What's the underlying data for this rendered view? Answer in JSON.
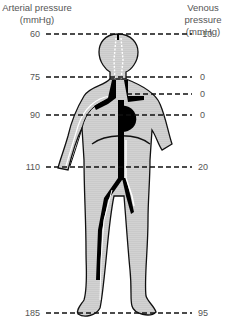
{
  "headers": {
    "arterial": [
      "Arterial pressure",
      "(mmHg)"
    ],
    "venous": [
      "Venous pressure",
      "(mmHg)"
    ]
  },
  "levels": [
    {
      "name": "head-top",
      "arterial": "60",
      "venous": "−10",
      "y": 34
    },
    {
      "name": "neck",
      "arterial": "75",
      "venous": "0",
      "y": 77
    },
    {
      "name": "shoulder",
      "arterial": "",
      "venous": "0",
      "y": 94
    },
    {
      "name": "heart",
      "arterial": "90",
      "venous": "0",
      "y": 115
    },
    {
      "name": "abdomen",
      "arterial": "110",
      "venous": "20",
      "y": 167
    },
    {
      "name": "feet",
      "arterial": "185",
      "venous": "95",
      "y": 313
    }
  ],
  "colors": {
    "body_fill": "#d9d9d9",
    "outline": "#111111",
    "vessel": "#000000",
    "dash": "#111111",
    "text": "#555555"
  }
}
